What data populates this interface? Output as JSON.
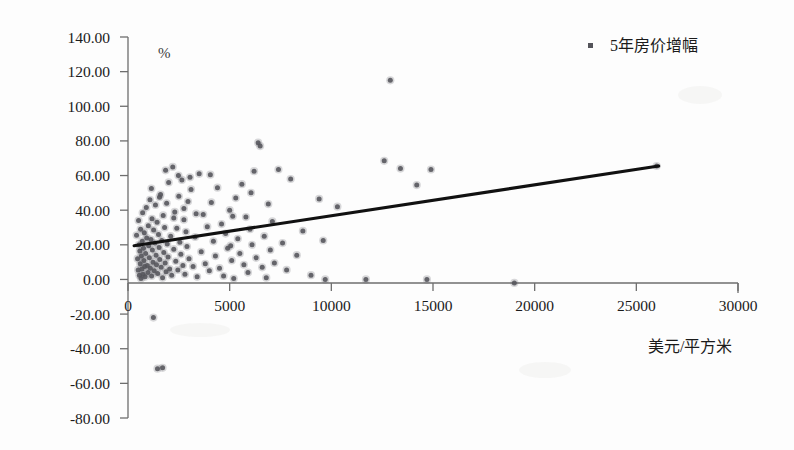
{
  "chart_data": {
    "type": "scatter",
    "title": "",
    "xlabel": "美元/平方米",
    "ylabel": "%",
    "xlim": [
      0,
      30000
    ],
    "ylim": [
      -80,
      140
    ],
    "grid": false,
    "legend_position": "top-right",
    "x_ticks": [
      "0",
      "5000",
      "10000",
      "15000",
      "20000",
      "25000",
      "30000"
    ],
    "x_tick_values": [
      0,
      5000,
      10000,
      15000,
      20000,
      25000,
      30000
    ],
    "y_ticks": [
      "140.00",
      "120.00",
      "100.00",
      "80.00",
      "60.00",
      "40.00",
      "20.00",
      "0.00",
      "-20.00",
      "-40.00",
      "-60.00",
      "-80.00"
    ],
    "y_tick_values": [
      140,
      120,
      100,
      80,
      60,
      40,
      20,
      0,
      -20,
      -40,
      -60,
      -80
    ],
    "series": [
      {
        "name": "5年房价增幅",
        "marker": "square-dot",
        "color": "#54545a",
        "points": [
          [
            420,
            25.5
          ],
          [
            470,
            12.0
          ],
          [
            500,
            5.5
          ],
          [
            520,
            34.0
          ],
          [
            540,
            20.0
          ],
          [
            560,
            2.5
          ],
          [
            580,
            16.5
          ],
          [
            600,
            9.0
          ],
          [
            620,
            29.0
          ],
          [
            640,
            0.5
          ],
          [
            660,
            13.5
          ],
          [
            690,
            6.0
          ],
          [
            700,
            22.0
          ],
          [
            720,
            38.5
          ],
          [
            740,
            3.0
          ],
          [
            760,
            18.0
          ],
          [
            780,
            11.0
          ],
          [
            800,
            27.0
          ],
          [
            820,
            7.5
          ],
          [
            840,
            1.5
          ],
          [
            870,
            15.0
          ],
          [
            900,
            41.5
          ],
          [
            920,
            24.0
          ],
          [
            950,
            8.0
          ],
          [
            980,
            4.0
          ],
          [
            1000,
            31.0
          ],
          [
            1020,
            19.5
          ],
          [
            1050,
            12.5
          ],
          [
            1080,
            46.0
          ],
          [
            1100,
            6.5
          ],
          [
            1130,
            23.0
          ],
          [
            1160,
            2.0
          ],
          [
            1180,
            35.0
          ],
          [
            1200,
            17.0
          ],
          [
            1230,
            10.0
          ],
          [
            1260,
            28.5
          ],
          [
            1290,
            5.0
          ],
          [
            1320,
            21.0
          ],
          [
            1350,
            43.0
          ],
          [
            1380,
            14.0
          ],
          [
            1400,
            8.5
          ],
          [
            1430,
            33.0
          ],
          [
            1460,
            3.5
          ],
          [
            1500,
            26.0
          ],
          [
            1530,
            18.5
          ],
          [
            1560,
            11.5
          ],
          [
            1600,
            49.0
          ],
          [
            1630,
            7.0
          ],
          [
            1660,
            22.5
          ],
          [
            1700,
            1.0
          ],
          [
            1730,
            37.0
          ],
          [
            1760,
            15.5
          ],
          [
            1800,
            30.0
          ],
          [
            1830,
            9.5
          ],
          [
            1870,
            4.5
          ],
          [
            1900,
            44.0
          ],
          [
            1930,
            20.5
          ],
          [
            1970,
            13.0
          ],
          [
            2000,
            56.0
          ],
          [
            2050,
            6.0
          ],
          [
            2100,
            25.0
          ],
          [
            2150,
            2.5
          ],
          [
            2200,
            65.0
          ],
          [
            2250,
            17.5
          ],
          [
            2300,
            39.0
          ],
          [
            2350,
            10.5
          ],
          [
            2400,
            29.5
          ],
          [
            2450,
            5.5
          ],
          [
            2500,
            48.0
          ],
          [
            2550,
            21.5
          ],
          [
            2600,
            14.5
          ],
          [
            2650,
            57.5
          ],
          [
            2700,
            8.0
          ],
          [
            2750,
            34.5
          ],
          [
            2800,
            3.0
          ],
          [
            2850,
            27.5
          ],
          [
            2900,
            19.0
          ],
          [
            2950,
            45.0
          ],
          [
            3000,
            12.0
          ],
          [
            3100,
            52.0
          ],
          [
            3200,
            7.5
          ],
          [
            3300,
            24.5
          ],
          [
            3400,
            1.5
          ],
          [
            3500,
            61.0
          ],
          [
            3600,
            16.0
          ],
          [
            3700,
            37.5
          ],
          [
            3800,
            9.0
          ],
          [
            3900,
            30.5
          ],
          [
            4000,
            5.0
          ],
          [
            4100,
            44.5
          ],
          [
            4200,
            22.0
          ],
          [
            4300,
            13.5
          ],
          [
            4400,
            53.0
          ],
          [
            4500,
            6.5
          ],
          [
            4600,
            32.0
          ],
          [
            4700,
            2.0
          ],
          [
            4800,
            26.5
          ],
          [
            4900,
            18.0
          ],
          [
            5000,
            40.0
          ],
          [
            5100,
            11.0
          ],
          [
            5200,
            0.5
          ],
          [
            5300,
            47.0
          ],
          [
            5400,
            23.5
          ],
          [
            5500,
            15.0
          ],
          [
            5600,
            55.0
          ],
          [
            5700,
            8.5
          ],
          [
            5800,
            36.0
          ],
          [
            5900,
            4.0
          ],
          [
            6000,
            29.0
          ],
          [
            6100,
            20.0
          ],
          [
            6200,
            62.5
          ],
          [
            6300,
            12.5
          ],
          [
            6400,
            79.0
          ],
          [
            6500,
            77.0
          ],
          [
            6600,
            7.0
          ],
          [
            6700,
            25.0
          ],
          [
            6800,
            1.0
          ],
          [
            6900,
            43.5
          ],
          [
            7000,
            17.0
          ],
          [
            7100,
            33.5
          ],
          [
            7200,
            9.5
          ],
          [
            7400,
            63.5
          ],
          [
            7600,
            21.0
          ],
          [
            7800,
            5.5
          ],
          [
            8000,
            58.0
          ],
          [
            8300,
            14.0
          ],
          [
            8600,
            28.0
          ],
          [
            9000,
            2.5
          ],
          [
            9400,
            46.5
          ],
          [
            9700,
            0.0
          ],
          [
            9600,
            22.5
          ],
          [
            10300,
            42.0
          ],
          [
            11700,
            0.0
          ],
          [
            12600,
            68.5
          ],
          [
            12900,
            115.0
          ],
          [
            13400,
            64.0
          ],
          [
            14200,
            54.5
          ],
          [
            14700,
            0.0
          ],
          [
            14900,
            63.5
          ],
          [
            19000,
            -2.0
          ],
          [
            26000,
            65.5
          ],
          [
            1250,
            -22.0
          ],
          [
            1450,
            -51.5
          ],
          [
            1700,
            -51.0
          ],
          [
            5050,
            19.5
          ],
          [
            5150,
            36.5
          ],
          [
            6050,
            50.0
          ],
          [
            4050,
            60.5
          ],
          [
            2480,
            60.0
          ],
          [
            3050,
            59.0
          ],
          [
            1850,
            63.0
          ],
          [
            2750,
            41.0
          ],
          [
            1150,
            52.5
          ],
          [
            1550,
            47.5
          ],
          [
            3350,
            38.0
          ],
          [
            2250,
            35.5
          ]
        ]
      }
    ],
    "trend_line": {
      "x_start": 300,
      "y_start": 19.5,
      "x_end": 26100,
      "y_end": 65.5,
      "color": "#111111"
    }
  },
  "legend": {
    "entries": [
      {
        "label": "5年房价增幅",
        "marker_color": "#54545a"
      }
    ]
  },
  "axes": {
    "y_unit_label": "%",
    "x_axis_title": "美元/平方米"
  }
}
